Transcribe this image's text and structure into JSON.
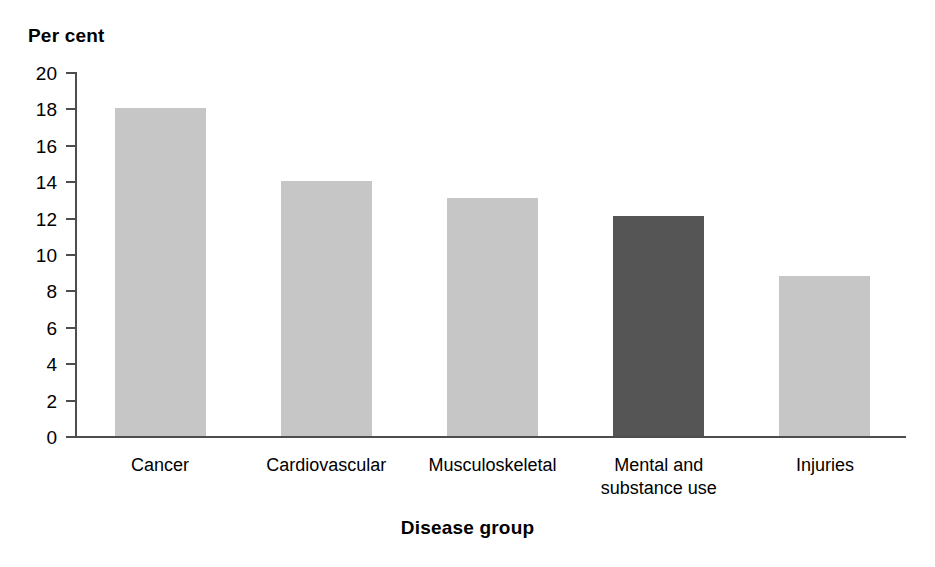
{
  "chart_data": {
    "type": "bar",
    "title": "",
    "xlabel": "Disease group",
    "ylabel": "Per cent",
    "categories": [
      "Cancer",
      "Cardiovascular",
      "Musculoskeletal",
      "Mental and\nsubstance use",
      "Injuries"
    ],
    "values": [
      18.0,
      14.0,
      13.1,
      12.1,
      8.8
    ],
    "ylim": [
      0,
      20
    ],
    "ytick_labels": [
      "20",
      "18",
      "16",
      "14",
      "12",
      "10",
      "8",
      "6",
      "4",
      "2",
      "0"
    ],
    "ytick_values": [
      20,
      18,
      16,
      14,
      12,
      10,
      8,
      6,
      4,
      2,
      0
    ],
    "grid": false,
    "legend": "none",
    "bar_colors": [
      "#c6c6c6",
      "#c6c6c6",
      "#c6c6c6",
      "#555555",
      "#c6c6c6"
    ],
    "highlight_category": "Mental and substance use",
    "axis_color": "#4d4d4d"
  },
  "axes": {
    "y_title": "Per cent",
    "x_title": "Disease group"
  }
}
